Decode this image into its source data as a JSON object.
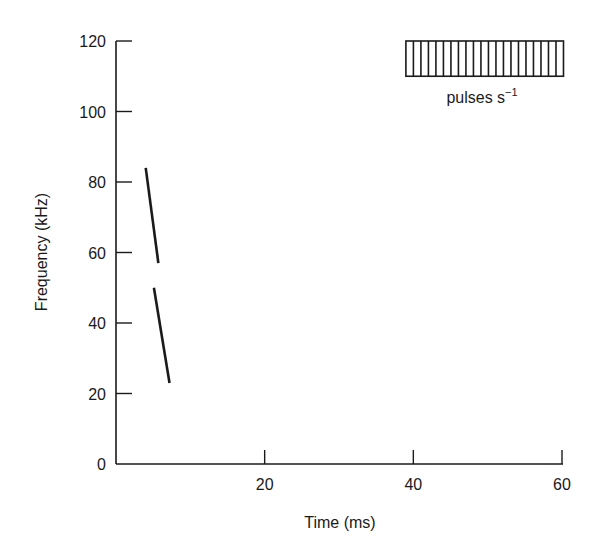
{
  "chart_data": {
    "type": "line",
    "title": "",
    "xlabel": "Time (ms)",
    "ylabel": "Frequency (kHz)",
    "xlim": [
      0,
      60
    ],
    "ylim": [
      0,
      120
    ],
    "xticks": [
      20,
      40,
      60
    ],
    "yticks": [
      0,
      20,
      40,
      60,
      80,
      100,
      120
    ],
    "grid": false,
    "series": [
      {
        "name": "FM sweep (upper segment)",
        "x": [
          4.0,
          5.7
        ],
        "y": [
          84,
          57
        ]
      },
      {
        "name": "FM sweep (lower segment)",
        "x": [
          5.1,
          7.2
        ],
        "y": [
          50,
          23
        ]
      }
    ],
    "annotations": [
      {
        "type": "pulse-train",
        "label": "pulses s⁻¹",
        "x_range": [
          39,
          60.2
        ],
        "y_range": [
          110,
          120
        ],
        "cells": 21
      }
    ]
  },
  "legend": {
    "pulse_label_text": "pulses s",
    "pulse_label_sup": "−1"
  },
  "axes": {
    "x_title": "Time (ms)",
    "y_title": "Frequency (kHz)",
    "x_tick_labels": [
      "20",
      "40",
      "60"
    ],
    "y_tick_labels": [
      "0",
      "20",
      "40",
      "60",
      "80",
      "100",
      "120"
    ]
  },
  "colors": {
    "ink": "#1a1a1a",
    "background": "#ffffff"
  }
}
